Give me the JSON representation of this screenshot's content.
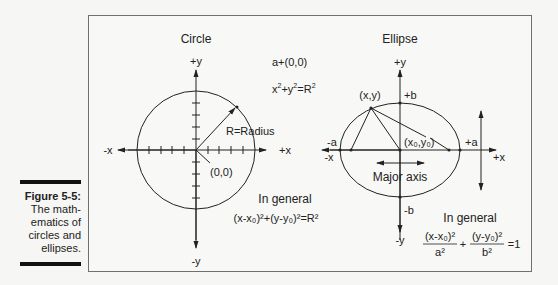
{
  "figure": {
    "number": "Figure 5-5:",
    "caption_lines": [
      "The math-",
      "ematics of",
      "circles and",
      "ellipses."
    ]
  },
  "circle": {
    "title": "Circle",
    "axes": {
      "pos_y": "+y",
      "neg_y": "-y",
      "pos_x": "+x",
      "neg_x": "-x"
    },
    "center_note": "a+(0,0)",
    "equation": {
      "base": "x",
      "sup1": "2",
      "plus": "+y",
      "sup2": "2",
      "eq": "=R",
      "sup3": "2"
    },
    "radius_label": "R=Radius",
    "origin_label": "(0,0)",
    "general_label": "In general",
    "general_equation": "(x-x₀)²+(y-y₀)²=R²"
  },
  "ellipse": {
    "title": "Ellipse",
    "axes": {
      "pos_y": "+y",
      "neg_y": "-y",
      "pos_x": "+x",
      "neg_x": "-x"
    },
    "point_label": "(x,y)",
    "pos_b": "+b",
    "neg_b": "-b",
    "pos_a": "+a",
    "neg_a": "-a",
    "center_label": "(x₀,y₀)",
    "major_axis_label": "Major axis",
    "general_label": "In general",
    "general_equation": {
      "term1_num": "(x-x₀)²",
      "term1_den": "a²",
      "plus": "+",
      "term2_num": "(y-y₀)²",
      "term2_den": "b²",
      "rhs": "=1"
    }
  }
}
